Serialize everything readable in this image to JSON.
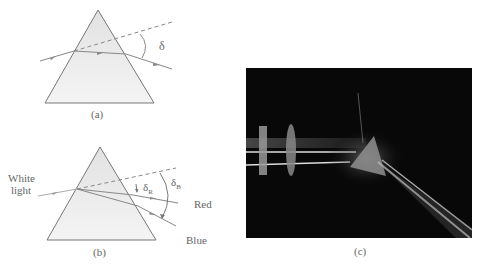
{
  "panel_a": {
    "caption": "(a)",
    "angle_label": "δ"
  },
  "panel_b": {
    "caption": "(b)",
    "incident_label_line1": "White",
    "incident_label_line2": "light",
    "angle_red_label": "δ",
    "angle_red_sub": "R",
    "angle_blue_label": "δ",
    "angle_blue_sub": "B",
    "ray_red_label": "Red",
    "ray_blue_label": "Blue"
  },
  "panel_c": {
    "caption": "(c)"
  },
  "colors": {
    "prism_fill": "#ececec",
    "line": "#777777",
    "photo_bg": "#080808"
  }
}
